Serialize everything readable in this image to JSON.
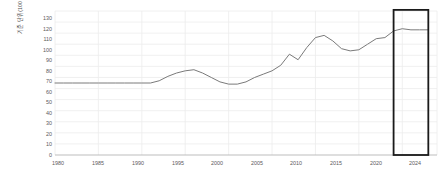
{
  "chart_data": {
    "type": "line",
    "title": "",
    "subtitle": "",
    "xlabel": "",
    "ylabel": "기준 단위(100 = 2016년 수치)",
    "xlim": [
      1980,
      2024
    ],
    "ylim": [
      0,
      130
    ],
    "grid": true,
    "legend": false,
    "legend_position": "none",
    "line_color": "#7a7a7a",
    "grid_color": "#ececec",
    "axis_color": "#b5b5b5",
    "highlight_color": "#1a1a1a",
    "yticks": [
      0,
      10,
      20,
      30,
      40,
      50,
      60,
      70,
      80,
      90,
      100,
      110,
      120,
      130
    ],
    "xticks": [
      1980,
      1985,
      1990,
      1995,
      2000,
      2005,
      2010,
      2015,
      2020,
      2024
    ],
    "annotations": [
      {
        "name": "highlight-box",
        "type": "rectangle",
        "x_start": 2019.0,
        "x_end": 2023.0,
        "y_start": 0,
        "y_end": 131,
        "stroke": "#1a1a1a",
        "fill": "none"
      }
    ],
    "x": [
      1980,
      1981,
      1982,
      1983,
      1984,
      1985,
      1986,
      1987,
      1988,
      1989,
      1990,
      1991,
      1992,
      1993,
      1994,
      1995,
      1996,
      1997,
      1998,
      1999,
      2000,
      2001,
      2002,
      2003,
      2004,
      2005,
      2006,
      2007,
      2008,
      2009,
      2010,
      2011,
      2012,
      2013,
      2014,
      2015,
      2016,
      2017,
      2018,
      2019,
      2020,
      2021,
      2022,
      2023
    ],
    "values": [
      65,
      65,
      65,
      65,
      65,
      65,
      65,
      65,
      65,
      65,
      65,
      65,
      67,
      71,
      74,
      76,
      77,
      74,
      70,
      66,
      64,
      64,
      66,
      70,
      73,
      76,
      81,
      91,
      86,
      97,
      106,
      108,
      103,
      96,
      94,
      95,
      100,
      105,
      106,
      112,
      114,
      113,
      113,
      113
    ],
    "series": [
      {
        "name": "지수",
        "values": [
          65,
          65,
          65,
          65,
          65,
          65,
          65,
          65,
          65,
          65,
          65,
          65,
          67,
          71,
          74,
          76,
          77,
          74,
          70,
          66,
          64,
          64,
          66,
          70,
          73,
          76,
          81,
          91,
          86,
          97,
          106,
          108,
          103,
          96,
          94,
          95,
          100,
          105,
          106,
          112,
          114,
          113,
          113,
          113
        ]
      }
    ]
  },
  "axes": {
    "y_title": "기준 단위(100 = 2016년 수치)",
    "y_tick_labels": [
      "130",
      "120",
      "110",
      "100",
      "90",
      "80",
      "70",
      "60",
      "50",
      "40",
      "30",
      "20",
      "10",
      "0"
    ],
    "x_tick_labels": [
      "1980",
      "1985",
      "1990",
      "1995",
      "2000",
      "2005",
      "2010",
      "2015",
      "2020",
      "2024"
    ]
  }
}
